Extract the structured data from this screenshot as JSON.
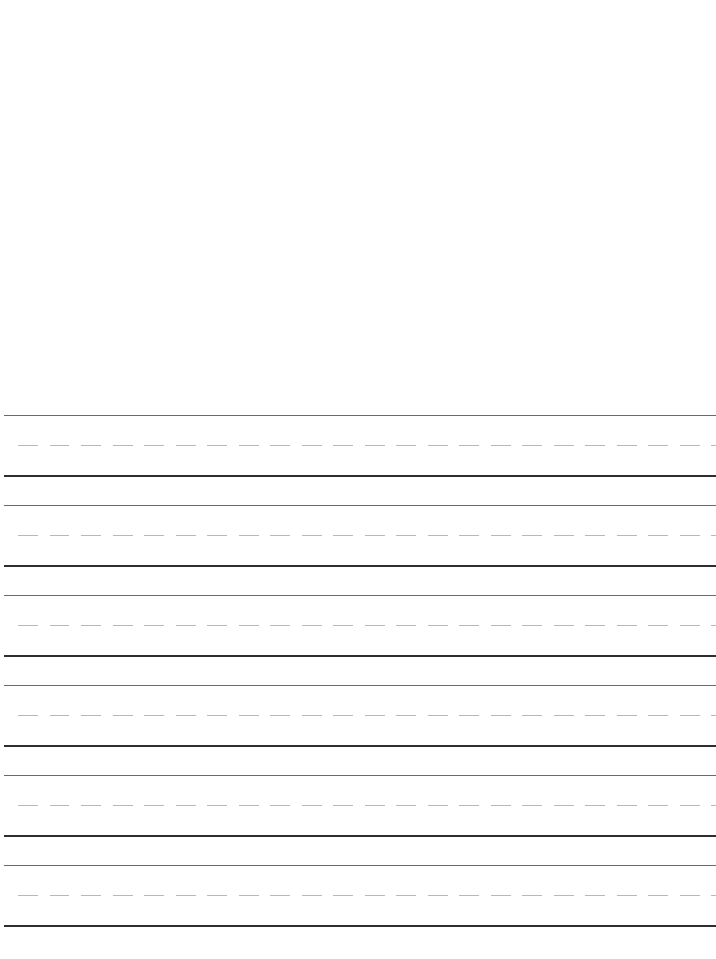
{
  "document": {
    "type": "handwriting-practice-sheet",
    "rows": [
      {
        "top": 415
      },
      {
        "top": 505
      },
      {
        "top": 595
      },
      {
        "top": 685
      },
      {
        "top": 775
      },
      {
        "top": 865
      }
    ],
    "colors": {
      "background": "#ffffff",
      "top_line": "#6a6a6a",
      "mid_dashed_line": "#b8b8b8",
      "base_line": "#2e2e2e"
    }
  }
}
